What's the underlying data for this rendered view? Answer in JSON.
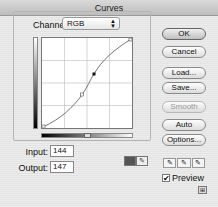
{
  "window": {
    "title": "Curves"
  },
  "channel": {
    "label": "Channel:",
    "selected": "RGB"
  },
  "graph": {
    "grid_divisions": 4,
    "points": [
      {
        "x": 0,
        "y": 0
      },
      {
        "x": 0.45,
        "y": 0.36
      },
      {
        "x": 0.58,
        "y": 0.6
      },
      {
        "x": 1,
        "y": 1
      }
    ],
    "selected_point_index": 2
  },
  "input": {
    "label": "Input:",
    "value": "144"
  },
  "output": {
    "label": "Output:",
    "value": "147"
  },
  "buttons": {
    "ok": "OK",
    "cancel": "Cancel",
    "load": "Load...",
    "save": "Save...",
    "smooth": "Smooth",
    "auto": "Auto",
    "options": "Options..."
  },
  "preview": {
    "label": "Preview",
    "checked": true
  },
  "icons": {
    "dropper": "✎",
    "check": "✔",
    "arrows": "▲▼",
    "expand": "⊞"
  }
}
